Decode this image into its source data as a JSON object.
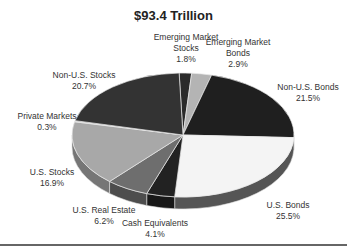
{
  "chart_data": {
    "type": "pie",
    "style": "3d",
    "title": "$93.4 Trillion",
    "unit": "%",
    "slices": [
      {
        "label": "Emerging Market Stocks",
        "value": 1.8,
        "display": "1.8%",
        "color": "#2b2b2b"
      },
      {
        "label": "Emerging Market Bonds",
        "value": 2.9,
        "display": "2.9%",
        "color": "#b4b4b4"
      },
      {
        "label": "Non-U.S. Bonds",
        "value": 21.5,
        "display": "21.5%",
        "color": "#1f1f1f"
      },
      {
        "label": "U.S. Bonds",
        "value": 25.5,
        "display": "25.5%",
        "color": "#f4f4f4"
      },
      {
        "label": "Cash Equivalents",
        "value": 4.1,
        "display": "4.1%",
        "color": "#222222"
      },
      {
        "label": "U.S. Real Estate",
        "value": 6.2,
        "display": "6.2%",
        "color": "#6e6e6e"
      },
      {
        "label": "U.S. Stocks",
        "value": 16.9,
        "display": "16.9%",
        "color": "#a8a8a8"
      },
      {
        "label": "Private Markets",
        "value": 0.3,
        "display": "0.3%",
        "color": "#d0d0d0"
      },
      {
        "label": "Non-U.S. Stocks",
        "value": 20.7,
        "display": "20.7%",
        "color": "#333333"
      }
    ],
    "total": 93.4,
    "total_unit": "Trillion USD",
    "legend": "none (direct labels)"
  },
  "labels": {
    "em_stocks": {
      "name": "Emerging Market",
      "name2": "Stocks",
      "pct": "1.8%"
    },
    "em_bonds": {
      "name": "Emerging Market",
      "name2": "Bonds",
      "pct": "2.9%"
    },
    "nonus_bonds": {
      "name": "Non-U.S. Bonds",
      "pct": "21.5%"
    },
    "us_bonds": {
      "name": "U.S. Bonds",
      "pct": "25.5%"
    },
    "cash": {
      "name": "Cash Equivalents",
      "pct": "4.1%"
    },
    "us_re": {
      "name": "U.S. Real Estate",
      "pct": "6.2%"
    },
    "us_stocks": {
      "name": "U.S. Stocks",
      "pct": "16.9%"
    },
    "private": {
      "name": "Private Markets",
      "pct": "0.3%"
    },
    "nonus_stocks": {
      "name": "Non-U.S. Stocks",
      "pct": "20.7%"
    }
  }
}
